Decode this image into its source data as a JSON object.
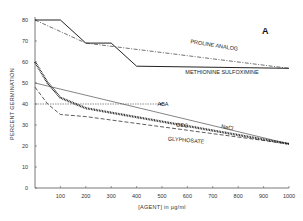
{
  "chart_data": {
    "type": "line",
    "title": "",
    "panel_label": "A",
    "xlabel": "[AGENT] in µg/ml",
    "ylabel": "PERCENT GERMINATION",
    "xlim": [
      0,
      1000
    ],
    "ylim": [
      0,
      80
    ],
    "x_ticks": [
      100,
      200,
      300,
      400,
      500,
      600,
      700,
      800,
      900,
      1000
    ],
    "y_ticks": [
      0,
      10,
      20,
      30,
      40,
      50,
      60,
      70,
      80
    ],
    "grid": false,
    "legend": "inline labels",
    "series": [
      {
        "name": "METHIONINE SULFOXIMINE",
        "style": "solid",
        "x": [
          0,
          100,
          200,
          300,
          400,
          1000
        ],
        "y": [
          80,
          80,
          69,
          69,
          58,
          57
        ]
      },
      {
        "name": "PROLINE ANALOG",
        "style": "dash-dot",
        "x": [
          0,
          200,
          1000
        ],
        "y": [
          80,
          69,
          57
        ]
      },
      {
        "name": "ABA",
        "style": "dotted-arrow",
        "x": [
          0,
          500
        ],
        "y": [
          40,
          40
        ]
      },
      {
        "name": "NaCl",
        "style": "thin-solid",
        "x": [
          0,
          1000
        ],
        "y": [
          50,
          21
        ]
      },
      {
        "name": "CCC",
        "style": "dashed",
        "x": [
          0,
          50,
          100,
          200,
          1000
        ],
        "y": [
          48,
          40,
          35,
          34,
          21
        ]
      },
      {
        "name": "GLYPHOSATE",
        "style": "thick-dotted",
        "x": [
          0,
          50,
          100,
          200,
          1000
        ],
        "y": [
          60,
          50,
          43,
          38,
          21
        ]
      }
    ]
  }
}
